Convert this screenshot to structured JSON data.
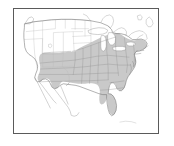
{
  "figure": {
    "kind": "distribution-range-map",
    "region": "United States of America (contiguous), with southern Canada and northern Mexico",
    "projection_note": "conic, north up",
    "title": "",
    "caption": "",
    "labels": [],
    "background_color": "#ffffff",
    "frame": {
      "color": "#5a5a5a",
      "width_px": 1.4,
      "x": 13,
      "y": 8,
      "w": 146,
      "h": 126
    },
    "legend": {
      "present": false,
      "entries": [
        {
          "swatch": "#c9c9c9",
          "label": "range / shaded states"
        },
        {
          "swatch": "#ffffff",
          "label": "outside range"
        }
      ]
    },
    "colors": {
      "shaded_fill": "#c9c9c9",
      "unshaded_fill": "#ffffff",
      "state_border_shaded": "#8c8c8c",
      "state_border_unshaded": "#b9b9b9",
      "country_outline": "#6f6f6f",
      "coastline": "#7a7a7a",
      "lake_fill": "#ffffff",
      "lake_outline": "#8a8a8a",
      "frame": "#5a5a5a"
    },
    "shaded_area": {
      "description": "Eastern and southeastern United States shaded light gray",
      "states_shaded": [
        "Texas (eastern)",
        "Oklahoma (eastern)",
        "Kansas (eastern)",
        "Nebraska (eastern)",
        "Iowa",
        "Minnesota (southeastern)",
        "Missouri",
        "Arkansas",
        "Louisiana",
        "Mississippi",
        "Alabama",
        "Georgia",
        "Florida",
        "South Carolina",
        "North Carolina",
        "Tennessee",
        "Kentucky",
        "Virginia",
        "West Virginia",
        "Maryland",
        "Delaware",
        "Illinois",
        "Indiana",
        "Ohio",
        "Michigan (southern)",
        "Wisconsin (southern)",
        "Pennsylvania",
        "New Jersey",
        "New York (southern)",
        "Connecticut",
        "Rhode Island",
        "Massachusetts"
      ],
      "states_unshaded": [
        "Washington",
        "Oregon",
        "California",
        "Idaho",
        "Nevada",
        "Utah",
        "Arizona",
        "Montana",
        "Wyoming",
        "Colorado",
        "New Mexico",
        "North Dakota",
        "South Dakota",
        "Texas (western)",
        "Maine",
        "Vermont",
        "New Hampshire"
      ]
    },
    "water_features": [
      "Lake Superior",
      "Lake Michigan",
      "Lake Huron",
      "Lake Erie",
      "Lake Ontario",
      "Great Salt Lake",
      "Gulf of Mexico",
      "Atlantic Ocean",
      "Pacific Ocean"
    ]
  }
}
